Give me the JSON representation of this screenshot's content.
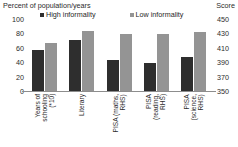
{
  "chart_data": {
    "type": "bar",
    "title": "",
    "categories": [
      "Years of\nschooling\n(*10)",
      "Literary",
      "PISA (maths,\nRHS)",
      "PISA\n(reading,\nRHS)",
      "PISA\n(science,\nRHS)"
    ],
    "series": [
      {
        "name": "High informality",
        "color": "#2e2e2e",
        "values": [
          58,
          72,
          393,
          390,
          398
        ]
      },
      {
        "name": "Low informality",
        "color": "#949494",
        "values": [
          68,
          85,
          430,
          431,
          433
        ]
      }
    ],
    "axes": {
      "left": {
        "label": "Percent of population/years",
        "ticks": [
          "100",
          "80",
          "60",
          "40",
          "20",
          "0"
        ],
        "lim": [
          0,
          100
        ],
        "applies_to_categories": [
          0,
          1
        ]
      },
      "right": {
        "label": "Score",
        "ticks": [
          "450",
          "430",
          "410",
          "390",
          "370",
          "350"
        ],
        "lim": [
          350,
          450
        ],
        "applies_to_categories": [
          2,
          3,
          4
        ]
      }
    },
    "grid": false,
    "legend_position": "top",
    "xlabel": "",
    "ylabel": "Percent of population/years"
  },
  "axis_captions": {
    "left": "Percent of population/years",
    "right": "Score"
  },
  "legend": {
    "items": [
      {
        "label": "High informality",
        "color": "#2e2e2e"
      },
      {
        "label": "Low informality",
        "color": "#949494"
      }
    ]
  },
  "left_ticks": [
    {
      "value": "100",
      "pos": 0
    },
    {
      "value": "80",
      "pos": 20
    },
    {
      "value": "60",
      "pos": 40
    },
    {
      "value": "40",
      "pos": 60
    },
    {
      "value": "20",
      "pos": 80
    },
    {
      "value": "0",
      "pos": 100
    }
  ],
  "right_ticks": [
    {
      "value": "450",
      "pos": 0
    },
    {
      "value": "430",
      "pos": 20
    },
    {
      "value": "410",
      "pos": 40
    },
    {
      "value": "390",
      "pos": 60
    },
    {
      "value": "370",
      "pos": 80
    },
    {
      "value": "350",
      "pos": 100
    }
  ]
}
